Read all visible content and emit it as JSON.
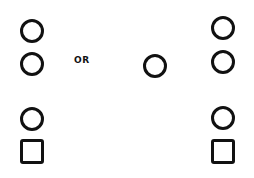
{
  "diagram": {
    "connector_label": "OR",
    "stroke_color": "#111111",
    "background_color": "#ffffff",
    "groups": [
      {
        "name": "left-stack",
        "shapes": [
          "circle",
          "circle",
          "circle",
          "square"
        ]
      },
      {
        "name": "middle",
        "shapes": [
          "circle"
        ]
      },
      {
        "name": "right-stack",
        "shapes": [
          "circle",
          "circle",
          "circle",
          "square"
        ]
      }
    ]
  }
}
